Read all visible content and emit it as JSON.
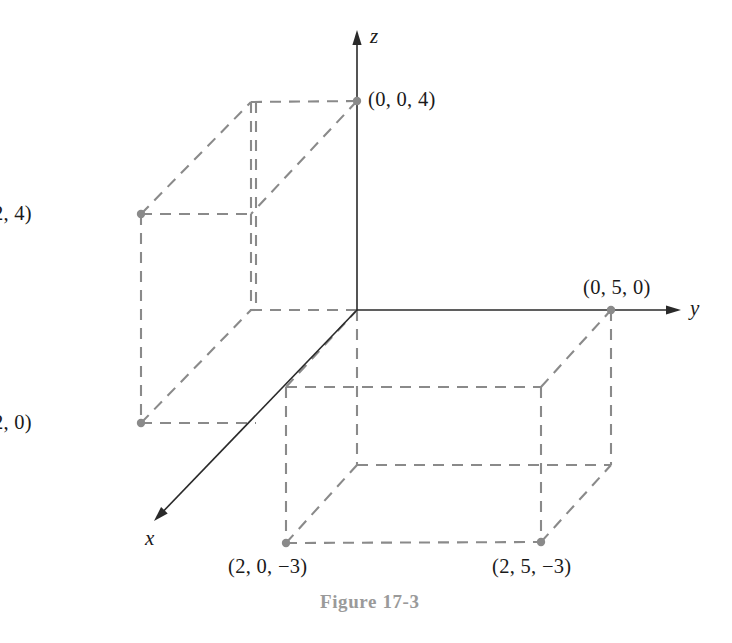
{
  "figure": {
    "caption": "Figure 17-3",
    "caption_x": 320,
    "caption_y": 592
  },
  "axes": {
    "origin": {
      "x": 357,
      "y": 310
    },
    "z": {
      "label": "z",
      "label_x": 370,
      "label_y": 26,
      "tip_x": 357,
      "tip_y": 30
    },
    "y": {
      "label": "y",
      "label_x": 690,
      "label_y": 298,
      "tip_x": 681,
      "tip_y": 310
    },
    "x": {
      "label": "x",
      "label_x": 145,
      "label_y": 528,
      "tip_x": 154,
      "tip_y": 521
    }
  },
  "points": [
    {
      "name": "point-0-0-4",
      "label": "(0, 0, 4)",
      "x": 357,
      "y": 101,
      "label_x": 368,
      "label_y": 89
    },
    {
      "name": "point-3-n2-4",
      "label": "(3, −2, 4)",
      "x": 141,
      "y": 214,
      "label_x": 32,
      "label_y": 203,
      "anchor": "end"
    },
    {
      "name": "point-3-n2-0",
      "label": "(3, −2, 0)",
      "x": 141,
      "y": 423,
      "label_x": 32,
      "label_y": 412,
      "anchor": "end"
    },
    {
      "name": "point-0-5-0",
      "label": "(0, 5, 0)",
      "x": 611,
      "y": 310,
      "label_x": 583,
      "label_y": 277
    },
    {
      "name": "point-2-0-n3",
      "label": "(2, 0, −3)",
      "x": 286,
      "y": 543,
      "label_x": 228,
      "label_y": 556
    },
    {
      "name": "point-2-5-n3",
      "label": "(2, 5, −3)",
      "x": 541,
      "y": 542,
      "label_x": 492,
      "label_y": 556
    }
  ],
  "box_left": {
    "name": "box-left-quadrant",
    "edges": [
      {
        "x1": 141,
        "y1": 214,
        "x2": 251,
        "y2": 102
      },
      {
        "x1": 251,
        "y1": 102,
        "x2": 357,
        "y2": 101
      },
      {
        "x1": 357,
        "y1": 101,
        "x2": 251,
        "y2": 214
      },
      {
        "x1": 141,
        "y1": 214,
        "x2": 251,
        "y2": 214
      },
      {
        "x1": 251,
        "y1": 102,
        "x2": 251,
        "y2": 214
      },
      {
        "x1": 256,
        "y1": 102,
        "x2": 256,
        "y2": 310
      },
      {
        "x1": 141,
        "y1": 214,
        "x2": 141,
        "y2": 423
      },
      {
        "x1": 251,
        "y1": 214,
        "x2": 251,
        "y2": 310
      },
      {
        "x1": 141,
        "y1": 423,
        "x2": 251,
        "y2": 310
      },
      {
        "x1": 141,
        "y1": 423,
        "x2": 256,
        "y2": 423
      },
      {
        "x1": 251,
        "y1": 310,
        "x2": 357,
        "y2": 310
      }
    ]
  },
  "box_right": {
    "name": "box-right-quadrant",
    "edges": [
      {
        "x1": 286,
        "y1": 387,
        "x2": 357,
        "y2": 310
      },
      {
        "x1": 286,
        "y1": 387,
        "x2": 541,
        "y2": 387
      },
      {
        "x1": 541,
        "y1": 387,
        "x2": 611,
        "y2": 310
      },
      {
        "x1": 357,
        "y1": 310,
        "x2": 357,
        "y2": 465
      },
      {
        "x1": 611,
        "y1": 310,
        "x2": 611,
        "y2": 465
      },
      {
        "x1": 286,
        "y1": 387,
        "x2": 286,
        "y2": 543
      },
      {
        "x1": 541,
        "y1": 387,
        "x2": 541,
        "y2": 542
      },
      {
        "x1": 357,
        "y1": 465,
        "x2": 611,
        "y2": 465
      },
      {
        "x1": 286,
        "y1": 543,
        "x2": 541,
        "y2": 542
      },
      {
        "x1": 286,
        "y1": 543,
        "x2": 357,
        "y2": 465
      },
      {
        "x1": 541,
        "y1": 542,
        "x2": 611,
        "y2": 465
      }
    ]
  },
  "style": {
    "edge_color": "#8a8a8a",
    "axis_color": "#2a2a2a",
    "dot_color": "#8a8a8a",
    "caption_color": "#9a9a9a",
    "background": "#ffffff"
  }
}
